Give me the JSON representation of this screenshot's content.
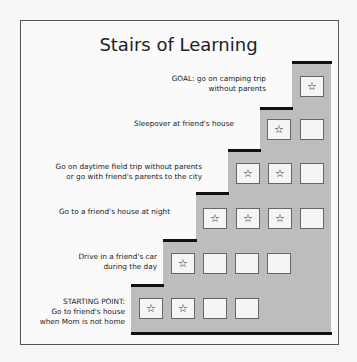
{
  "title": "Stairs of Learning",
  "steps": [
    {
      "label": [
        "GOAL: go on camping trip",
        "without parents"
      ],
      "boxes": [
        "star"
      ]
    },
    {
      "label": [
        "Sleepover at friend's house"
      ],
      "boxes": [
        "star",
        "empty"
      ]
    },
    {
      "label": [
        "Go on daytime field trip without parents",
        "or go with friend's parents to the city"
      ],
      "boxes": [
        "star",
        "star",
        "empty"
      ]
    },
    {
      "label": [
        "Go to a friend's house at night"
      ],
      "boxes": [
        "star",
        "star",
        "star",
        "empty"
      ]
    },
    {
      "label": [
        "Drive in a friend's car",
        "during the day"
      ],
      "boxes": [
        "star",
        "empty",
        "empty",
        "empty"
      ]
    },
    {
      "label": [
        "STARTING POINT:",
        "Go to friend's house",
        "when Mom is not home"
      ],
      "boxes": [
        "star",
        "star",
        "empty",
        "empty"
      ]
    }
  ],
  "star_glyph": "☆"
}
